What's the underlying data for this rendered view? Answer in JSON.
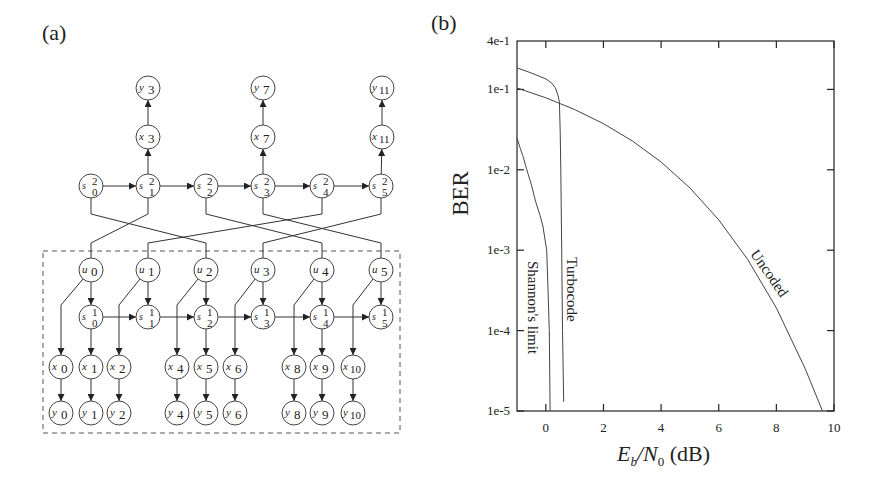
{
  "panel_a": {
    "label": "(a)",
    "nodes": [
      {
        "id": "y3",
        "base": "y",
        "sub": "3",
        "sup": "",
        "cx": 148,
        "cy": 88
      },
      {
        "id": "y7",
        "base": "y",
        "sub": "7",
        "sup": "",
        "cx": 263,
        "cy": 88
      },
      {
        "id": "y11",
        "base": "y",
        "sub": "11",
        "sup": "",
        "cx": 382,
        "cy": 88
      },
      {
        "id": "x3",
        "base": "x",
        "sub": "3",
        "sup": "",
        "cx": 148,
        "cy": 137
      },
      {
        "id": "x7",
        "base": "x",
        "sub": "7",
        "sup": "",
        "cx": 263,
        "cy": 137
      },
      {
        "id": "x11",
        "base": "x",
        "sub": "11",
        "sup": "",
        "cx": 382,
        "cy": 137
      },
      {
        "id": "s2_0",
        "base": "s",
        "sub": "0",
        "sup": "2",
        "cx": 91,
        "cy": 186
      },
      {
        "id": "s2_1",
        "base": "s",
        "sub": "1",
        "sup": "2",
        "cx": 148,
        "cy": 186
      },
      {
        "id": "s2_2",
        "base": "s",
        "sub": "2",
        "sup": "2",
        "cx": 206,
        "cy": 186
      },
      {
        "id": "s2_3",
        "base": "s",
        "sub": "3",
        "sup": "2",
        "cx": 263,
        "cy": 186
      },
      {
        "id": "s2_4",
        "base": "s",
        "sub": "4",
        "sup": "2",
        "cx": 322,
        "cy": 186
      },
      {
        "id": "s2_5",
        "base": "s",
        "sub": "5",
        "sup": "2",
        "cx": 381,
        "cy": 186
      },
      {
        "id": "u0",
        "base": "u",
        "sub": "0",
        "sup": "",
        "cx": 91,
        "cy": 270
      },
      {
        "id": "u1",
        "base": "u",
        "sub": "1",
        "sup": "",
        "cx": 148,
        "cy": 270
      },
      {
        "id": "u2",
        "base": "u",
        "sub": "2",
        "sup": "",
        "cx": 206,
        "cy": 270
      },
      {
        "id": "u3",
        "base": "u",
        "sub": "3",
        "sup": "",
        "cx": 263,
        "cy": 270
      },
      {
        "id": "u4",
        "base": "u",
        "sub": "4",
        "sup": "",
        "cx": 322,
        "cy": 270
      },
      {
        "id": "u5",
        "base": "u",
        "sub": "5",
        "sup": "",
        "cx": 381,
        "cy": 270
      },
      {
        "id": "s1_0",
        "base": "s",
        "sub": "0",
        "sup": "1",
        "cx": 91,
        "cy": 317
      },
      {
        "id": "s1_1",
        "base": "s",
        "sub": "1",
        "sup": "1",
        "cx": 148,
        "cy": 317
      },
      {
        "id": "s1_2",
        "base": "s",
        "sub": "2",
        "sup": "1",
        "cx": 206,
        "cy": 317
      },
      {
        "id": "s1_3",
        "base": "s",
        "sub": "3",
        "sup": "1",
        "cx": 263,
        "cy": 317
      },
      {
        "id": "s1_4",
        "base": "s",
        "sub": "4",
        "sup": "1",
        "cx": 322,
        "cy": 317
      },
      {
        "id": "s1_5",
        "base": "s",
        "sub": "5",
        "sup": "1",
        "cx": 381,
        "cy": 317
      },
      {
        "id": "x0",
        "base": "x",
        "sub": "0",
        "sup": "",
        "cx": 61,
        "cy": 367
      },
      {
        "id": "x1",
        "base": "x",
        "sub": "1",
        "sup": "",
        "cx": 91,
        "cy": 367
      },
      {
        "id": "x2",
        "base": "x",
        "sub": "2",
        "sup": "",
        "cx": 119,
        "cy": 367
      },
      {
        "id": "x4",
        "base": "x",
        "sub": "4",
        "sup": "",
        "cx": 177,
        "cy": 367
      },
      {
        "id": "x5",
        "base": "x",
        "sub": "5",
        "sup": "",
        "cx": 206,
        "cy": 367
      },
      {
        "id": "x6",
        "base": "x",
        "sub": "6",
        "sup": "",
        "cx": 235,
        "cy": 367
      },
      {
        "id": "x8",
        "base": "x",
        "sub": "8",
        "sup": "",
        "cx": 294,
        "cy": 367
      },
      {
        "id": "x9",
        "base": "x",
        "sub": "9",
        "sup": "",
        "cx": 322,
        "cy": 367
      },
      {
        "id": "x10",
        "base": "x",
        "sub": "10",
        "sup": "",
        "cx": 353,
        "cy": 367
      },
      {
        "id": "y0",
        "base": "y",
        "sub": "0",
        "sup": "",
        "cx": 61,
        "cy": 413
      },
      {
        "id": "y1",
        "base": "y",
        "sub": "1",
        "sup": "",
        "cx": 91,
        "cy": 413
      },
      {
        "id": "y2",
        "base": "y",
        "sub": "2",
        "sup": "",
        "cx": 119,
        "cy": 413
      },
      {
        "id": "y4",
        "base": "y",
        "sub": "4",
        "sup": "",
        "cx": 177,
        "cy": 413
      },
      {
        "id": "y5",
        "base": "y",
        "sub": "5",
        "sup": "",
        "cx": 206,
        "cy": 413
      },
      {
        "id": "y6",
        "base": "y",
        "sub": "6",
        "sup": "",
        "cx": 235,
        "cy": 413
      },
      {
        "id": "y8",
        "base": "y",
        "sub": "8",
        "sup": "",
        "cx": 294,
        "cy": 413
      },
      {
        "id": "y9",
        "base": "y",
        "sub": "9",
        "sup": "",
        "cx": 322,
        "cy": 413
      },
      {
        "id": "y10",
        "base": "y",
        "sub": "10",
        "sup": "",
        "cx": 353,
        "cy": 413
      }
    ],
    "edges": [
      {
        "from": "x3",
        "to": "y3"
      },
      {
        "from": "x7",
        "to": "y7"
      },
      {
        "from": "x11",
        "to": "y11"
      },
      {
        "from": "s2_1",
        "to": "x3"
      },
      {
        "from": "s2_3",
        "to": "x7"
      },
      {
        "from": "s2_5",
        "to": "x11"
      },
      {
        "from": "s2_0",
        "to": "s2_1"
      },
      {
        "from": "s2_1",
        "to": "s2_2"
      },
      {
        "from": "s2_2",
        "to": "s2_3"
      },
      {
        "from": "s2_3",
        "to": "s2_4"
      },
      {
        "from": "s2_4",
        "to": "s2_5"
      },
      {
        "from": "u0",
        "to": "s1_0"
      },
      {
        "from": "u1",
        "to": "s1_1"
      },
      {
        "from": "u2",
        "to": "s1_2"
      },
      {
        "from": "u3",
        "to": "s1_3"
      },
      {
        "from": "u4",
        "to": "s1_4"
      },
      {
        "from": "u5",
        "to": "s1_5"
      },
      {
        "from": "s1_0",
        "to": "s1_1"
      },
      {
        "from": "s1_1",
        "to": "s1_2"
      },
      {
        "from": "s1_2",
        "to": "s1_3"
      },
      {
        "from": "s1_3",
        "to": "s1_4"
      },
      {
        "from": "s1_4",
        "to": "s1_5"
      },
      {
        "from": "s1_0",
        "to": "x1"
      },
      {
        "from": "s1_2",
        "to": "x5"
      },
      {
        "from": "s1_4",
        "to": "x9"
      },
      {
        "from": "x0",
        "to": "y0"
      },
      {
        "from": "x1",
        "to": "y1"
      },
      {
        "from": "x2",
        "to": "y2"
      },
      {
        "from": "x4",
        "to": "y4"
      },
      {
        "from": "x5",
        "to": "y5"
      },
      {
        "from": "x6",
        "to": "y6"
      },
      {
        "from": "x8",
        "to": "y8"
      },
      {
        "from": "x9",
        "to": "y9"
      },
      {
        "from": "x10",
        "to": "y10"
      }
    ],
    "systematic_edges": [
      {
        "from": "u0",
        "to": "x0"
      },
      {
        "from": "u1",
        "to": "x2"
      },
      {
        "from": "u2",
        "to": "x4"
      },
      {
        "from": "u3",
        "to": "x6"
      },
      {
        "from": "u4",
        "to": "x8"
      },
      {
        "from": "u5",
        "to": "x10"
      }
    ],
    "interleaver_edges": [
      {
        "from": "u0",
        "to": "s2_1"
      },
      {
        "from": "u1",
        "to": "s2_4"
      },
      {
        "from": "u2",
        "to": "s2_0"
      },
      {
        "from": "u3",
        "to": "s2_5"
      },
      {
        "from": "u4",
        "to": "s2_2"
      },
      {
        "from": "u5",
        "to": "s2_3"
      }
    ],
    "dashed_box": {
      "x": 43,
      "y": 251,
      "w": 357,
      "h": 182
    }
  },
  "panel_b": {
    "label": "(b)"
  },
  "chart_data": {
    "type": "line",
    "title": "",
    "xlabel": "E_b/N_0 (dB)",
    "ylabel": "BER",
    "xscale": "linear",
    "yscale": "log",
    "xlim": [
      -1,
      10
    ],
    "ylim": [
      1e-05,
      0.4
    ],
    "x_ticks": [
      0,
      2,
      4,
      6,
      8,
      10
    ],
    "x_tick_labels": [
      "0",
      "2",
      "4",
      "6",
      "8",
      "10"
    ],
    "y_ticks": [
      0.4,
      0.1,
      0.01,
      0.001,
      0.0001,
      1e-05
    ],
    "y_tick_labels": [
      "4e-1",
      "1e-1",
      "1e-2",
      "1e-3",
      "1e-4",
      "1e-5"
    ],
    "grid": false,
    "legend": "none (curves labeled inline)",
    "series": [
      {
        "name": "Shannon's limit",
        "x": [
          -1.0,
          -0.9,
          -0.8,
          -0.66,
          -0.5,
          -0.35,
          -0.2,
          -0.1,
          0.03,
          0.08,
          0.12,
          0.15
        ],
        "y": [
          0.025,
          0.019,
          0.015,
          0.01,
          0.0065,
          0.004,
          0.0027,
          0.002,
          0.001,
          0.0003,
          0.0001,
          1e-05
        ]
      },
      {
        "name": "Turbocode",
        "x": [
          -1.0,
          -0.5,
          0.0,
          0.2,
          0.33,
          0.42,
          0.47,
          0.5,
          0.52,
          0.55,
          0.58,
          0.62
        ],
        "y": [
          0.185,
          0.16,
          0.135,
          0.12,
          0.105,
          0.085,
          0.07,
          0.03,
          0.01,
          0.001,
          0.0001,
          1.3e-05
        ]
      },
      {
        "name": "Uncoded",
        "x": [
          -1,
          0,
          1,
          2,
          3,
          4,
          5,
          6,
          7,
          8,
          9,
          9.6
        ],
        "y": [
          0.104,
          0.0786,
          0.0563,
          0.0375,
          0.0229,
          0.0125,
          0.00595,
          0.00239,
          0.000773,
          0.000191,
          3.36e-05,
          1e-05
        ]
      }
    ],
    "annotations": [
      {
        "text": "Shannon's limit",
        "rotation": 90
      },
      {
        "text": "Turbocode",
        "rotation": 90
      },
      {
        "text": "Uncoded",
        "rotation": 55
      }
    ]
  }
}
